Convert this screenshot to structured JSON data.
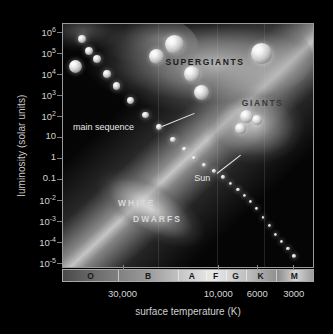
{
  "figure": {
    "y_axis_label": "luminosity (solar units)",
    "x_axis_label": "surface temperature (K)"
  },
  "chart_data": {
    "type": "scatter",
    "xlabel": "surface temperature (K)",
    "ylabel": "luminosity (solar units)",
    "xscale": "log-reversed",
    "yscale": "log",
    "xlim": [
      50000,
      2000
    ],
    "ylim": [
      1e-05,
      1000000.0
    ],
    "grid": true,
    "legend": "none",
    "y_ticks": [
      {
        "label": "10",
        "exp": "6",
        "value": 1000000
      },
      {
        "label": "10",
        "exp": "5",
        "value": 100000
      },
      {
        "label": "10",
        "exp": "4",
        "value": 10000
      },
      {
        "label": "10",
        "exp": "3",
        "value": 1000
      },
      {
        "label": "10",
        "exp": "2",
        "value": 100
      },
      {
        "label": "10",
        "exp": "",
        "value": 10
      },
      {
        "label": "1",
        "exp": "",
        "value": 1
      },
      {
        "label": "0.1",
        "exp": "",
        "value": 0.1
      },
      {
        "label": "10",
        "exp": "-2",
        "value": 0.01
      },
      {
        "label": "10",
        "exp": "-3",
        "value": 0.001
      },
      {
        "label": "10",
        "exp": "-4",
        "value": 0.0001
      },
      {
        "label": "10",
        "exp": "-5",
        "value": 1e-05
      }
    ],
    "x_ticks": [
      {
        "label": "30,000",
        "value": 30000
      },
      {
        "label": "10,000",
        "value": 10000
      },
      {
        "label": "6000",
        "value": 6000
      },
      {
        "label": "3000",
        "value": 3000
      }
    ],
    "spectral_classes": [
      {
        "label": "O",
        "start_pct": 0,
        "end_pct": 22
      },
      {
        "label": "B",
        "start_pct": 22,
        "end_pct": 46
      },
      {
        "label": "A",
        "start_pct": 46,
        "end_pct": 57
      },
      {
        "label": "F",
        "start_pct": 57,
        "end_pct": 65
      },
      {
        "label": "G",
        "start_pct": 65,
        "end_pct": 73
      },
      {
        "label": "K",
        "start_pct": 73,
        "end_pct": 85
      },
      {
        "label": "M",
        "start_pct": 85,
        "end_pct": 100
      }
    ],
    "regions": [
      {
        "name": "SUPERGIANTS",
        "label": "SUPERGIANTS",
        "x_pct": 52,
        "y_pct": 16
      },
      {
        "name": "GIANTS",
        "label": "GIANTS",
        "x_pct": 79,
        "y_pct": 33
      },
      {
        "name": "WHITE DWARFS",
        "label_line1": "WHITE",
        "label_line2": "DWARFS",
        "x_pct": 32,
        "y_pct": 76
      },
      {
        "name": "main sequence",
        "label": "main sequence",
        "x_pct": 14,
        "y_pct": 44
      },
      {
        "name": "Sun",
        "label": "Sun",
        "x_pct": 57,
        "y_pct": 62
      }
    ],
    "main_sequence_points": [
      {
        "x_pct": 7.5,
        "y_pct": 6.0,
        "r": 4.0
      },
      {
        "x_pct": 10.5,
        "y_pct": 11.0,
        "r": 4.2
      },
      {
        "x_pct": 13.5,
        "y_pct": 14.5,
        "r": 4.0
      },
      {
        "x_pct": 17.5,
        "y_pct": 20.5,
        "r": 3.8
      },
      {
        "x_pct": 21.5,
        "y_pct": 25.5,
        "r": 3.6
      },
      {
        "x_pct": 27.0,
        "y_pct": 31.5,
        "r": 3.4
      },
      {
        "x_pct": 33.0,
        "y_pct": 37.5,
        "r": 3.1
      },
      {
        "x_pct": 38.5,
        "y_pct": 42.5,
        "r": 2.9
      },
      {
        "x_pct": 44.0,
        "y_pct": 47.5,
        "r": 2.6
      },
      {
        "x_pct": 48.5,
        "y_pct": 51.5,
        "r": 2.3
      },
      {
        "x_pct": 52.5,
        "y_pct": 55.0,
        "r": 2.1
      },
      {
        "x_pct": 56.5,
        "y_pct": 58.0,
        "r": 1.9
      },
      {
        "x_pct": 60.5,
        "y_pct": 60.5,
        "r": 1.8
      },
      {
        "x_pct": 64.0,
        "y_pct": 63.0,
        "r": 1.7
      },
      {
        "x_pct": 67.0,
        "y_pct": 65.5,
        "r": 1.6
      },
      {
        "x_pct": 70.0,
        "y_pct": 68.0,
        "r": 1.6
      },
      {
        "x_pct": 72.5,
        "y_pct": 70.5,
        "r": 1.5
      },
      {
        "x_pct": 75.0,
        "y_pct": 73.0,
        "r": 1.5
      },
      {
        "x_pct": 77.5,
        "y_pct": 76.0,
        "r": 1.4
      },
      {
        "x_pct": 80.0,
        "y_pct": 79.5,
        "r": 1.4
      },
      {
        "x_pct": 82.5,
        "y_pct": 83.0,
        "r": 1.5
      },
      {
        "x_pct": 85.0,
        "y_pct": 86.5,
        "r": 1.6
      },
      {
        "x_pct": 87.5,
        "y_pct": 89.5,
        "r": 1.6
      },
      {
        "x_pct": 90.0,
        "y_pct": 92.5,
        "r": 1.7
      },
      {
        "x_pct": 92.5,
        "y_pct": 95.5,
        "r": 1.8
      }
    ],
    "supergiant_points": [
      {
        "x_pct": 44.5,
        "y_pct": 8.5,
        "r": 9.5
      },
      {
        "x_pct": 37.5,
        "y_pct": 13.5,
        "r": 7.5
      },
      {
        "x_pct": 79.5,
        "y_pct": 12.0,
        "r": 10.5
      },
      {
        "x_pct": 51.5,
        "y_pct": 20.5,
        "r": 8.0
      },
      {
        "x_pct": 55.5,
        "y_pct": 28.0,
        "r": 7.5
      },
      {
        "x_pct": 5.0,
        "y_pct": 17.5,
        "r": 6.5
      }
    ],
    "giant_points": [
      {
        "x_pct": 73.5,
        "y_pct": 38.0,
        "r": 6.5
      },
      {
        "x_pct": 77.5,
        "y_pct": 39.5,
        "r": 5.0
      },
      {
        "x_pct": 71.0,
        "y_pct": 43.0,
        "r": 5.5
      }
    ]
  }
}
